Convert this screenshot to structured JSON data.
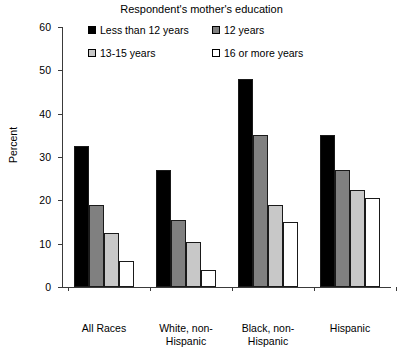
{
  "chart_data": {
    "type": "bar",
    "title": "Respondent's mother's education",
    "xlabel": "",
    "ylabel": "Percent",
    "ylim": [
      0,
      60
    ],
    "yticks": [
      0,
      10,
      20,
      30,
      40,
      50,
      60
    ],
    "grid": false,
    "legend_position": "top-center",
    "categories": [
      "All Races",
      "White, non-Hispanic",
      "Black, non-Hispanic",
      "Hispanic"
    ],
    "category_lines": [
      [
        "All Races"
      ],
      [
        "White, non-",
        "Hispanic"
      ],
      [
        "Black, non-",
        "Hispanic"
      ],
      [
        "Hispanic"
      ]
    ],
    "series": [
      {
        "name": "Less than 12 years",
        "color": "#000000",
        "values": [
          32.5,
          27.0,
          48.0,
          35.0
        ]
      },
      {
        "name": "12 years",
        "color": "#808080",
        "values": [
          19.0,
          15.5,
          35.0,
          27.0
        ]
      },
      {
        "name": "13-15 years",
        "color": "#c8c8c8",
        "values": [
          12.5,
          10.5,
          19.0,
          22.5
        ]
      },
      {
        "name": "16 or more years",
        "color": "#ffffff",
        "values": [
          6.0,
          4.0,
          15.0,
          20.5
        ]
      }
    ]
  }
}
